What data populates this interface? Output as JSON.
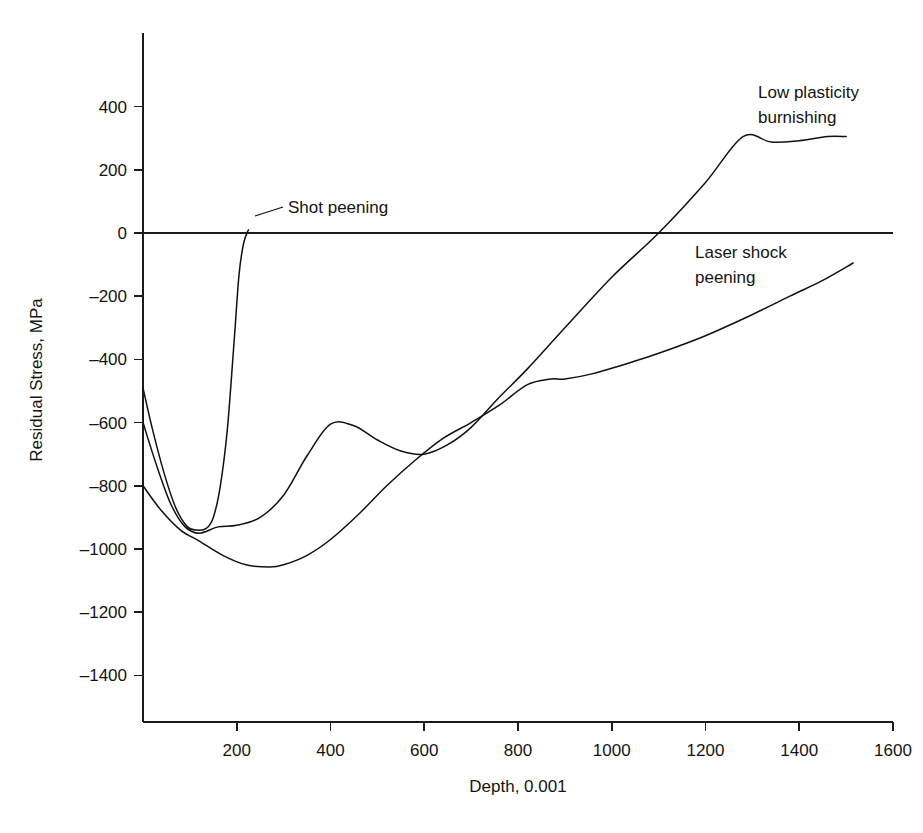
{
  "chart_data": {
    "type": "line",
    "title": "",
    "xlabel": "Depth, 0.001",
    "ylabel": "Residual Stress, MPa",
    "xlim": [
      0,
      1600
    ],
    "ylim": [
      -1500,
      520
    ],
    "grid": false,
    "legend_position": "inline-annotations",
    "xticks": [
      0,
      200,
      400,
      600,
      800,
      1000,
      1200,
      1400,
      1600
    ],
    "xtick_labels": [
      "",
      "200",
      "400",
      "600",
      "800",
      "1000",
      "1200",
      "1400",
      "1600"
    ],
    "yticks": [
      400,
      200,
      0,
      -200,
      -400,
      -600,
      -800,
      -1000,
      -1200,
      -1400
    ],
    "ytick_labels": [
      "400",
      "200",
      "0",
      "-200",
      "-400",
      "-600",
      "-800",
      "-1000",
      "-1200",
      "-1400"
    ],
    "zero_reference_line": 0,
    "series": [
      {
        "name": "Shot peening",
        "label": "Shot peening",
        "color": "#111111",
        "x": [
          0,
          20,
          45,
          70,
          95,
          115,
          135,
          150,
          165,
          180,
          195,
          205,
          215,
          225
        ],
        "values": [
          -490,
          -620,
          -760,
          -870,
          -930,
          -940,
          -935,
          -900,
          -800,
          -620,
          -330,
          -130,
          -30,
          10
        ]
      },
      {
        "name": "Low plasticity burnishing",
        "label": "Low plasticity burnishing",
        "color": "#111111",
        "x": [
          0,
          30,
          60,
          90,
          120,
          160,
          200,
          250,
          300,
          350,
          400,
          450,
          500,
          550,
          600,
          650,
          700,
          760,
          820,
          900,
          1000,
          1100,
          1200,
          1280,
          1340,
          1400,
          1460,
          1500
        ],
        "values": [
          -600,
          -740,
          -860,
          -930,
          -950,
          -930,
          -925,
          -900,
          -830,
          -705,
          -605,
          -610,
          -655,
          -690,
          -700,
          -670,
          -615,
          -520,
          -430,
          -300,
          -140,
          0,
          160,
          305,
          288,
          292,
          305,
          305
        ]
      },
      {
        "name": "Laser shock peening",
        "label": "Laser shock peening",
        "color": "#111111",
        "x": [
          0,
          40,
          80,
          120,
          170,
          220,
          270,
          300,
          350,
          400,
          460,
          520,
          580,
          640,
          700,
          760,
          820,
          870,
          900,
          960,
          1040,
          1120,
          1200,
          1290,
          1380,
          1450,
          1515
        ],
        "values": [
          -800,
          -880,
          -940,
          -975,
          -1020,
          -1050,
          -1057,
          -1050,
          -1020,
          -970,
          -890,
          -800,
          -720,
          -650,
          -600,
          -545,
          -480,
          -462,
          -462,
          -445,
          -410,
          -370,
          -325,
          -265,
          -200,
          -150,
          -95
        ]
      }
    ],
    "annotations": [
      {
        "name": "shot-peening-label",
        "text": "Shot peening",
        "text_x": 288,
        "text_y": 213,
        "anchor": "start",
        "leader": "M 283 207 L 255 216"
      },
      {
        "name": "low-plasticity-burnishing-label",
        "text_line1": "Low plasticity",
        "text_line2": "burnishing",
        "text_x": 758,
        "text_y": 98,
        "anchor": "start"
      },
      {
        "name": "laser-shock-peening-label",
        "text_line1": "Laser shock",
        "text_line2": "peening",
        "text_x": 695,
        "text_y": 258,
        "anchor": "start"
      }
    ]
  },
  "axes": {
    "x_axis_pixel_start": 143,
    "x_axis_pixel_end": 893,
    "y_axis_pixel_zero": 233
  }
}
